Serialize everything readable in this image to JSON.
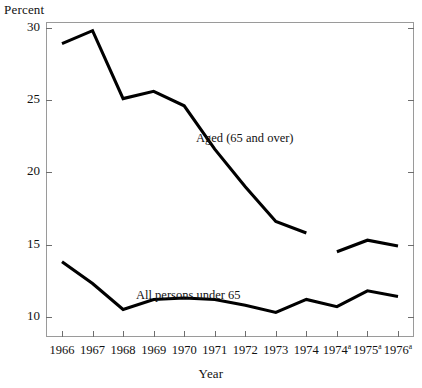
{
  "chart_data": {
    "type": "line",
    "title": "",
    "xlabel": "Year",
    "ylabel": "Percent",
    "categories": [
      "1966",
      "1967",
      "1968",
      "1969",
      "1970",
      "1971",
      "1972",
      "1973",
      "1974",
      "1974a",
      "1975a",
      "1976a"
    ],
    "tick_labels": [
      "1966",
      "1967",
      "1968",
      "1969",
      "1970",
      "1971",
      "1972",
      "1973",
      "1974",
      "1974",
      "1975",
      "1976"
    ],
    "tick_superscripts": [
      "",
      "",
      "",
      "",
      "",
      "",
      "",
      "",
      "",
      "a",
      "a",
      "a"
    ],
    "ylim": [
      8.6,
      30.4
    ],
    "ytick_values": [
      30,
      25,
      20,
      15,
      10
    ],
    "ytick_labels": [
      "30",
      "25",
      "20",
      "15",
      "10"
    ],
    "grid": false,
    "legend_position": "inline-annotation",
    "series": [
      {
        "name": "Aged (65 and over)",
        "annotation": "Aged (65 and over)",
        "color": "#000000",
        "break_after_index": 8,
        "values": [
          28.9,
          29.8,
          25.1,
          25.6,
          24.6,
          21.6,
          19.0,
          16.6,
          15.8,
          14.5,
          15.3,
          14.9
        ]
      },
      {
        "name": "All persons under 65",
        "annotation": "All persons under 65",
        "color": "#000000",
        "values": [
          13.8,
          12.3,
          10.5,
          11.2,
          11.3,
          11.2,
          10.8,
          10.3,
          11.2,
          10.7,
          11.8,
          11.4
        ]
      }
    ]
  },
  "axes": {
    "y_title": "Percent",
    "x_title": "Year"
  }
}
